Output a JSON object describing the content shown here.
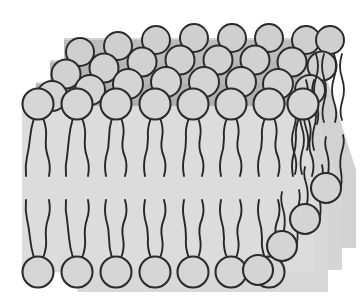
{
  "figure": {
    "title": "Lipid bilayer membrane",
    "view": "oblique-3d-cutaway",
    "labels": [],
    "annotations": []
  },
  "canvas": {
    "width": 364,
    "height": 299,
    "background_color": "#ffffff"
  },
  "colors": {
    "background": "#ffffff",
    "head_fill": "#d6d6d6",
    "head_fill_back": "#cfcfcf",
    "head_stroke": "#2b2b2b",
    "tail_stroke": "#262626",
    "membrane_interior": "#dcdcdc",
    "membrane_interior_back": "#d2d2d2",
    "shadow_band": "#a9a9a9",
    "shadow_band_soft": "#bdbdbd"
  },
  "geometry": {
    "head_radius_front": 15,
    "head_radius_back": 14,
    "head_stroke_width": 2,
    "tail_stroke_width": 1.9,
    "tail_count_per_lipid": 2,
    "leaflets": 2,
    "depth_rows": 4,
    "row_x_offset": 14,
    "row_y_offset": -22,
    "front_row_top_head_y": 104,
    "front_row_bottom_head_y": 272,
    "membrane_midline_y": 190
  },
  "structure": {
    "upper_leaflet": {
      "name": "outer-leaflet",
      "head_orientation": "up",
      "tail_direction": "down"
    },
    "lower_leaflet": {
      "name": "inner-leaflet",
      "head_orientation": "down",
      "tail_direction": "up"
    },
    "front_row_upper_head_x": [
      38,
      77,
      116,
      155,
      193,
      231,
      269,
      303
    ],
    "front_row_lower_head_x": [
      38,
      77,
      116,
      155,
      193,
      231,
      269
    ],
    "right_edge_staircase_heads": [
      {
        "cx": 326,
        "cy": 188
      },
      {
        "cx": 305,
        "cy": 219
      },
      {
        "cx": 282,
        "cy": 246
      },
      {
        "cx": 258,
        "cy": 270
      }
    ]
  }
}
